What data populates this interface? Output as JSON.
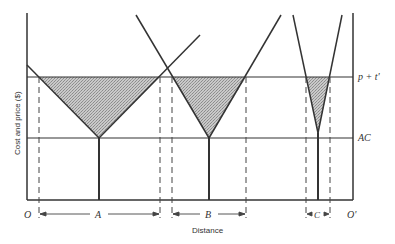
{
  "diagram": {
    "type": "spatial market areas",
    "y_axis_label": "Cost and price ($)",
    "x_axis_label": "Distance",
    "origin_left": "O",
    "origin_right": "O'",
    "price_line_label": "p + t'",
    "cost_line_label": "AC",
    "market_areas": [
      {
        "label": "A"
      },
      {
        "label": "B"
      },
      {
        "label": "C"
      }
    ],
    "colors": {
      "line": "#333333",
      "shade": "#bdbdbd",
      "background": "#ffffff"
    }
  }
}
